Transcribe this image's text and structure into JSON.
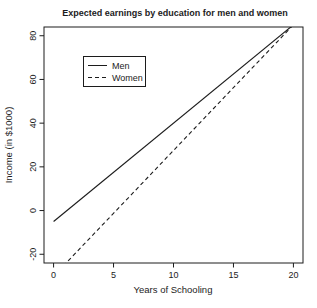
{
  "colors": {
    "background": "#ffffff",
    "line": "#1c1c1c",
    "text": "#1c1c1c"
  },
  "chart_data": {
    "type": "line",
    "title": "Expected earnings by education for men and women",
    "xlabel": "Years of Schooling",
    "ylabel": "Income (in $1000)",
    "xlim": [
      -0.8,
      20.8
    ],
    "ylim": [
      -24,
      84
    ],
    "x_ticks": [
      0,
      5,
      10,
      15,
      20
    ],
    "y_ticks": [
      -20,
      0,
      20,
      40,
      60,
      80
    ],
    "grid": false,
    "legend": {
      "position": "upper-left",
      "entries": [
        {
          "label": "Men",
          "line_style": "solid"
        },
        {
          "label": "Women",
          "line_style": "dashed"
        }
      ]
    },
    "series": [
      {
        "name": "Men",
        "line_style": "solid",
        "color": "#1c1c1c",
        "x": [
          0,
          20
        ],
        "y": [
          -5,
          85
        ]
      },
      {
        "name": "Women",
        "line_style": "dashed",
        "color": "#1c1c1c",
        "x": [
          0,
          20
        ],
        "y": [
          -30,
          85
        ]
      }
    ]
  }
}
